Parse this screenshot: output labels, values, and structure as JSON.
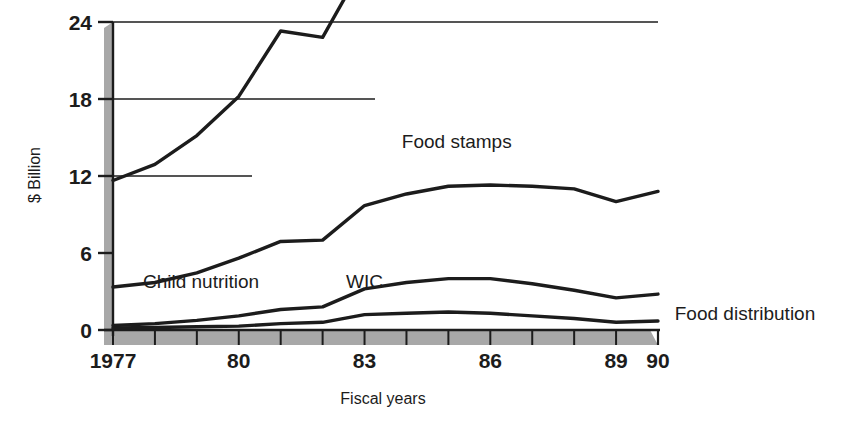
{
  "chart_data": {
    "type": "line",
    "title": "",
    "xlabel": "Fiscal years",
    "ylabel": "$ Billion",
    "xlim": [
      1977,
      1990
    ],
    "ylim": [
      0,
      24
    ],
    "yticks": [
      0,
      6,
      12,
      18,
      24
    ],
    "ytick_labels": [
      "0",
      "6",
      "12",
      "18",
      "24"
    ],
    "x": [
      1977,
      1978,
      1979,
      1980,
      1981,
      1982,
      1983,
      1984,
      1985,
      1986,
      1987,
      1988,
      1989,
      1990
    ],
    "xtick_values": [
      1977,
      1980,
      1983,
      1986,
      1989,
      1990
    ],
    "xtick_labels": [
      "1977",
      "80",
      "83",
      "86",
      "89",
      "90"
    ],
    "grid": "horizontal-partial",
    "legend_position": "inline-annotations",
    "stacking": "cumulative",
    "series": [
      {
        "name": "Food stamps",
        "label": "Food stamps",
        "values": [
          8.3,
          9.2,
          10.7,
          12.6,
          16.4,
          15.8,
          18.9,
          19.3,
          19.7,
          20.1,
          20.5,
          21.1,
          20.8,
          23.6
        ],
        "color": "#1c1c1c"
      },
      {
        "name": "Child nutrition",
        "label": "Child nutrition",
        "values": [
          3.0,
          3.2,
          3.7,
          4.5,
          5.3,
          5.2,
          6.5,
          6.9,
          7.2,
          7.3,
          7.6,
          7.9,
          7.5,
          8.0
        ],
        "color": "#1c1c1c"
      },
      {
        "name": "WIC",
        "label": "WIC",
        "values": [
          0.2,
          0.3,
          0.5,
          0.8,
          1.1,
          1.2,
          2.0,
          2.4,
          2.6,
          2.7,
          2.5,
          2.2,
          1.9,
          2.1
        ],
        "color": "#1c1c1c"
      },
      {
        "name": "Food distribution",
        "label": "Food distribution",
        "values": [
          0.15,
          0.2,
          0.25,
          0.3,
          0.5,
          0.6,
          1.2,
          1.3,
          1.4,
          1.3,
          1.1,
          0.9,
          0.6,
          0.7
        ],
        "color": "#1c1c1c"
      }
    ],
    "annotations": [
      {
        "text": "Food stamps",
        "x": 1985.2,
        "y": 14.2
      },
      {
        "text": "Child nutrition",
        "x": 1979.1,
        "y": 3.3
      },
      {
        "text": "WIC",
        "x": 1983.0,
        "y": 3.3
      },
      {
        "text": "Food distribution",
        "x": 1990.4,
        "y": 0.8
      }
    ]
  },
  "axes": {
    "y_axis_title": "$ Billion",
    "x_axis_title": "Fiscal years",
    "y_tick_labels": [
      "24",
      "18",
      "12",
      "6",
      "0"
    ],
    "x_tick_labels": [
      "1977",
      "80",
      "83",
      "86",
      "89",
      "90"
    ]
  },
  "colors": {
    "line": "#1c1c1c",
    "band": "#a8a8a8",
    "grid": "#1c1c1c",
    "background": "#ffffff"
  }
}
